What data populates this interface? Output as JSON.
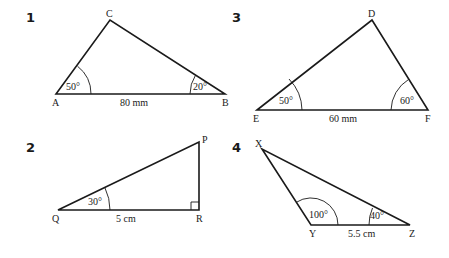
{
  "figures": [
    {
      "number": "1",
      "vertices": {
        "A": "A",
        "B": "B",
        "C": "C"
      },
      "angles": {
        "A": "50°",
        "B": "20°"
      },
      "side": "80 mm"
    },
    {
      "number": "2",
      "vertices": {
        "Q": "Q",
        "P": "P",
        "R": "R"
      },
      "angles": {
        "Q": "30°",
        "R": "90° (right angle)"
      },
      "side": "5 cm"
    },
    {
      "number": "3",
      "vertices": {
        "E": "E",
        "D": "D",
        "F": "F"
      },
      "angles": {
        "E": "50°",
        "F": "60°"
      },
      "side": "60 mm"
    },
    {
      "number": "4",
      "vertices": {
        "X": "X",
        "Y": "Y",
        "Z": "Z"
      },
      "angles": {
        "Y": "100°",
        "Z": "40°"
      },
      "side": "5.5 cm"
    }
  ],
  "colors": {
    "ink": "#1a1a1a",
    "background": "#ffffff"
  }
}
